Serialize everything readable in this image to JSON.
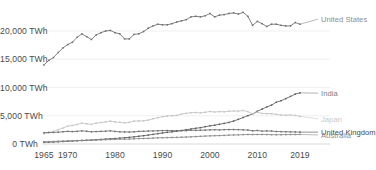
{
  "chart_data": {
    "type": "line",
    "title": "",
    "xlabel": "",
    "ylabel": "",
    "grid": true,
    "legend_position": "right-inline",
    "x": [
      1965,
      1966,
      1967,
      1968,
      1969,
      1970,
      1971,
      1972,
      1973,
      1974,
      1975,
      1976,
      1977,
      1978,
      1979,
      1980,
      1981,
      1982,
      1983,
      1984,
      1985,
      1986,
      1987,
      1988,
      1989,
      1990,
      1991,
      1992,
      1993,
      1994,
      1995,
      1996,
      1997,
      1998,
      1999,
      2000,
      2001,
      2002,
      2003,
      2004,
      2005,
      2006,
      2007,
      2008,
      2009,
      2010,
      2011,
      2012,
      2013,
      2014,
      2015,
      2016,
      2017,
      2018,
      2019
    ],
    "xlim": [
      1965,
      2019
    ],
    "ylim": [
      0,
      24000
    ],
    "yticks": [
      0,
      5000,
      10000,
      15000,
      20000
    ],
    "ytick_labels": [
      "0 TWh",
      "5,000 TWh",
      "10,000 TWh",
      "15,000 TWh",
      "20,000 TWh"
    ],
    "xticks": [
      1965,
      1970,
      1980,
      1990,
      2000,
      2010,
      2019
    ],
    "xtick_labels": [
      "1965",
      "1970",
      "1980",
      "1990",
      "2000",
      "2010",
      "2019"
    ],
    "series": [
      {
        "name": "United States",
        "color": "#6b6b6b",
        "label_color": "#8d8d8d",
        "label_value": 22100,
        "values": [
          14000,
          14800,
          15300,
          16200,
          17000,
          17600,
          18000,
          18900,
          19500,
          19000,
          18500,
          19300,
          19700,
          20000,
          20100,
          19700,
          19500,
          18600,
          18600,
          19400,
          19500,
          19900,
          20500,
          21300,
          21700,
          21600,
          21600,
          21900,
          22300,
          22600,
          22900,
          23600,
          23900,
          24000,
          24200,
          24800,
          24300,
          24700,
          24800,
          25100,
          25300,
          25100,
          25500,
          24900,
          23200,
          24000,
          23700,
          23200,
          23700,
          23800,
          23500,
          23400,
          23400,
          24000,
          23700
        ],
        "normalized_values": [
          14000,
          14800,
          15300,
          16200,
          17000,
          17600,
          18000,
          18900,
          19500,
          19000,
          18500,
          19300,
          19700,
          20000,
          20100,
          19700,
          19500,
          18600,
          18600,
          19400,
          19500,
          19900,
          20500,
          20900,
          21200,
          21100,
          21100,
          21300,
          21600,
          21800,
          22000,
          22500,
          22600,
          22500,
          22700,
          23100,
          22500,
          22800,
          22900,
          23100,
          23200,
          23000,
          23300,
          22600,
          21000,
          21700,
          21300,
          20800,
          21200,
          21200,
          21000,
          20900,
          20900,
          21500,
          21200
        ]
      },
      {
        "name": "India",
        "color": "#5c5c5c",
        "label_color": "#7d7d7d",
        "label_value": 9000,
        "values": [
          300,
          330,
          360,
          400,
          440,
          490,
          530,
          570,
          620,
          650,
          700,
          760,
          810,
          870,
          930,
          970,
          1040,
          1110,
          1180,
          1270,
          1370,
          1470,
          1580,
          1700,
          1830,
          1950,
          2060,
          2160,
          2260,
          2380,
          2520,
          2650,
          2780,
          2890,
          3060,
          3220,
          3330,
          3490,
          3640,
          3820,
          4060,
          4360,
          4690,
          5010,
          5330,
          5790,
          6180,
          6560,
          6890,
          7390,
          7660,
          8030,
          8420,
          8830,
          9050
        ]
      },
      {
        "name": "Japan",
        "color": "#c3c3c3",
        "label_color": "#c8c8c8",
        "label_value": 4450,
        "values": [
          1800,
          2000,
          2250,
          2520,
          2820,
          3150,
          3280,
          3450,
          3700,
          3560,
          3480,
          3680,
          3800,
          3900,
          4050,
          3900,
          3830,
          3740,
          3830,
          4060,
          4080,
          4100,
          4220,
          4480,
          4660,
          4840,
          4960,
          5010,
          5060,
          5300,
          5430,
          5540,
          5570,
          5500,
          5610,
          5750,
          5660,
          5730,
          5700,
          5800,
          5840,
          5820,
          5930,
          5730,
          5340,
          5620,
          5410,
          5380,
          5360,
          5250,
          5130,
          5100,
          5140,
          5060,
          4900
        ]
      },
      {
        "name": "United Kingdom",
        "color": "#6f6f6f",
        "label_color": "#4a4a4a",
        "label_value": 2100,
        "values": [
          2000,
          2050,
          2040,
          2090,
          2170,
          2230,
          2200,
          2240,
          2330,
          2250,
          2170,
          2200,
          2230,
          2260,
          2340,
          2220,
          2160,
          2130,
          2130,
          2150,
          2230,
          2250,
          2290,
          2320,
          2340,
          2370,
          2380,
          2360,
          2360,
          2370,
          2370,
          2430,
          2410,
          2440,
          2460,
          2500,
          2530,
          2500,
          2540,
          2550,
          2560,
          2540,
          2500,
          2470,
          2330,
          2390,
          2280,
          2310,
          2290,
          2210,
          2180,
          2170,
          2140,
          2130,
          2100
        ]
      },
      {
        "name": "Australia",
        "color": "#8a8a8a",
        "label_color": "#8d8d8d",
        "label_value": 1600,
        "values": [
          400,
          420,
          450,
          480,
          510,
          550,
          580,
          610,
          640,
          660,
          680,
          710,
          740,
          770,
          800,
          820,
          850,
          860,
          880,
          920,
          960,
          980,
          1000,
          1050,
          1090,
          1110,
          1130,
          1150,
          1170,
          1200,
          1230,
          1270,
          1310,
          1360,
          1400,
          1440,
          1470,
          1490,
          1520,
          1570,
          1600,
          1620,
          1660,
          1680,
          1670,
          1680,
          1680,
          1670,
          1650,
          1640,
          1650,
          1660,
          1670,
          1680,
          1690
        ]
      }
    ]
  },
  "geometry": {
    "plot_left": 44,
    "plot_right": 300,
    "y_zero_px": 144,
    "px_per_unit": 0.00565
  }
}
